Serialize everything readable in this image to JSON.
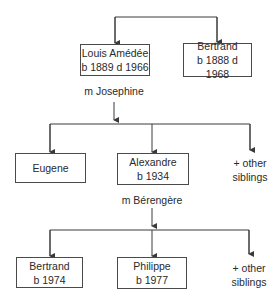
{
  "diagram": {
    "type": "family-tree",
    "generation1": [
      {
        "id": "louis",
        "name": "Louis Amédée",
        "dates": "b 1889 d 1966"
      },
      {
        "id": "bertrand_elder",
        "name": "Bertrand",
        "dates": "b 1888 d 1968"
      }
    ],
    "marriage1": "m Josephine",
    "generation2": [
      {
        "id": "eugene",
        "name": "Eugene",
        "dates": ""
      },
      {
        "id": "alexandre",
        "name": "Alexandre",
        "dates": "b 1934"
      },
      {
        "id": "others2",
        "line1": "+ other",
        "line2": "siblings"
      }
    ],
    "marriage2": "m Bérengère",
    "generation3": [
      {
        "id": "bertrand_younger",
        "name": "Bertrand",
        "dates": "b 1974"
      },
      {
        "id": "philippe",
        "name": "Philippe",
        "dates": "b 1977"
      },
      {
        "id": "others3",
        "line1": "+ other",
        "line2": "siblings"
      }
    ],
    "colors": {
      "line": "#3a3a3a",
      "border": "#4a4a4a",
      "text": "#2a2a2a"
    }
  }
}
